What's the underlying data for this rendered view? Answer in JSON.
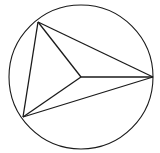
{
  "diagram": {
    "stroke_color": "#1a1a1a",
    "background": "#ffffff",
    "circle": {
      "cx": 81,
      "cy": 77,
      "r": 72
    },
    "vertices": {
      "A": {
        "x": 38,
        "y": 22
      },
      "B": {
        "x": 23,
        "y": 117
      },
      "C": {
        "x": 153,
        "y": 77
      }
    },
    "center_point": {
      "x": 81,
      "y": 77
    }
  }
}
